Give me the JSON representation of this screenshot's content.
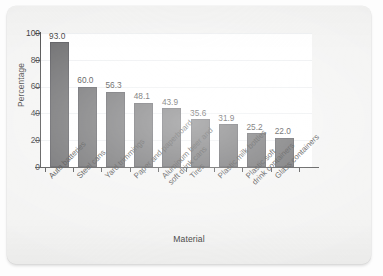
{
  "chart_data": {
    "type": "bar",
    "title": "",
    "xlabel": "Material",
    "ylabel": "Percentage",
    "ylim": [
      0,
      100
    ],
    "yticks": [
      0,
      20,
      40,
      60,
      80,
      100
    ],
    "ytick_labels": [
      "0",
      "20",
      "40",
      "60",
      "80",
      "100"
    ],
    "grid": true,
    "grid_axis": "y",
    "legend": false,
    "bar_color": "#58585a",
    "plot_background": "#ffffff",
    "figure_background": "#f3f3f2",
    "categories": [
      "Auto batteries",
      "Steel cans",
      "Yard trimmings",
      "Paper and paperboard",
      "Aluminum beer and soft drink cans",
      "Tires",
      "Plastic milk bottles",
      "Plastic soft drink containers",
      "Glass containers"
    ],
    "category_label_lines": [
      [
        "Auto batteries"
      ],
      [
        "Steel cans"
      ],
      [
        "Yard trimmings"
      ],
      [
        "Paper and paperboard"
      ],
      [
        "Aluminum beer and",
        "soft drink cans"
      ],
      [
        "Tires"
      ],
      [
        "Plastic milk bottles"
      ],
      [
        "Plastic soft",
        "drink containers"
      ],
      [
        "Glass containers"
      ]
    ],
    "values": [
      93.0,
      60.0,
      56.3,
      48.1,
      43.9,
      35.6,
      31.9,
      25.2,
      22.0
    ],
    "value_labels": [
      "93.0",
      "60.0",
      "56.3",
      "48.1",
      "43.9",
      "35.6",
      "31.9",
      "25.2",
      "22.0"
    ]
  }
}
